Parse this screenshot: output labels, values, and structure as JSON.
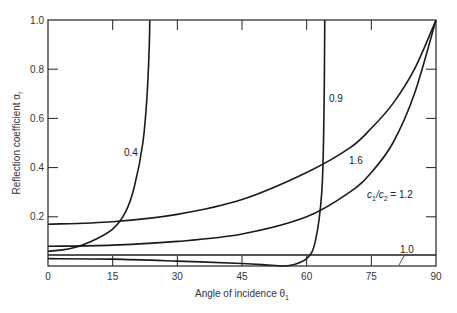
{
  "chart_data": {
    "type": "line",
    "title": "",
    "xlabel": "Angle of incidence θ1",
    "ylabel": "Reflection coefficient αr",
    "xlim": [
      0,
      90
    ],
    "ylim": [
      0,
      1.0
    ],
    "xticks": [
      "0",
      "15",
      "30",
      "45",
      "60",
      "75",
      "90"
    ],
    "yticks": [
      "0",
      "0.2",
      "0.4",
      "0.6",
      "0.8",
      "1.0"
    ],
    "grid": false,
    "legend": "inline curve labels",
    "series": [
      {
        "name": "0.4",
        "label": "0.4",
        "x": [
          0,
          5,
          10,
          15,
          18,
          20,
          22,
          23,
          23.5,
          23.6
        ],
        "y": [
          0.06,
          0.07,
          0.1,
          0.15,
          0.22,
          0.32,
          0.5,
          0.7,
          0.9,
          1.0
        ]
      },
      {
        "name": "0.9",
        "label": "0.9",
        "x": [
          0,
          15,
          30,
          45,
          52,
          56,
          60,
          62,
          63.5,
          64,
          64.2
        ],
        "y": [
          0.03,
          0.028,
          0.02,
          0.01,
          0.003,
          0.002,
          0.03,
          0.1,
          0.3,
          0.6,
          1.0
        ]
      },
      {
        "name": "1.0",
        "label": "1.0",
        "x": [
          0,
          90
        ],
        "y": [
          0.045,
          0.045
        ]
      },
      {
        "name": "1.2",
        "label": "c1/c2 = 1.2",
        "x": [
          0,
          15,
          30,
          45,
          60,
          70,
          75,
          80,
          85,
          90
        ],
        "y": [
          0.08,
          0.085,
          0.1,
          0.13,
          0.2,
          0.3,
          0.38,
          0.5,
          0.7,
          1.0
        ]
      },
      {
        "name": "1.6",
        "label": "1.6",
        "x": [
          0,
          15,
          30,
          45,
          60,
          70,
          75,
          80,
          85,
          90
        ],
        "y": [
          0.17,
          0.18,
          0.21,
          0.27,
          0.38,
          0.48,
          0.56,
          0.66,
          0.8,
          1.0
        ]
      }
    ],
    "annotations": [
      "0.4",
      "0.9",
      "1.6",
      "c1/c2 = 1.2",
      "1.0"
    ]
  },
  "labels": {
    "xlabel_main": "Angle of incidence θ",
    "xlabel_sub": "1",
    "ylabel_main": "Reflection coefficient α",
    "ylabel_sub": "r",
    "curve_04": "0.4",
    "curve_09": "0.9",
    "curve_16": "1.6",
    "curve_12_c1": "c",
    "curve_12_s1": "1",
    "curve_12_slash": "/c",
    "curve_12_s2": "2",
    "curve_12_val": " = 1.2",
    "curve_10": "1.0"
  }
}
